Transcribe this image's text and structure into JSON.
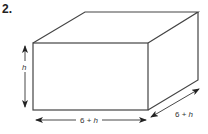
{
  "problem_number": "2.",
  "figure": {
    "type": "rectangular-prism",
    "dimensions": {
      "height_label": "h",
      "width_label": "6 + h",
      "depth_label": "6 + h"
    }
  }
}
